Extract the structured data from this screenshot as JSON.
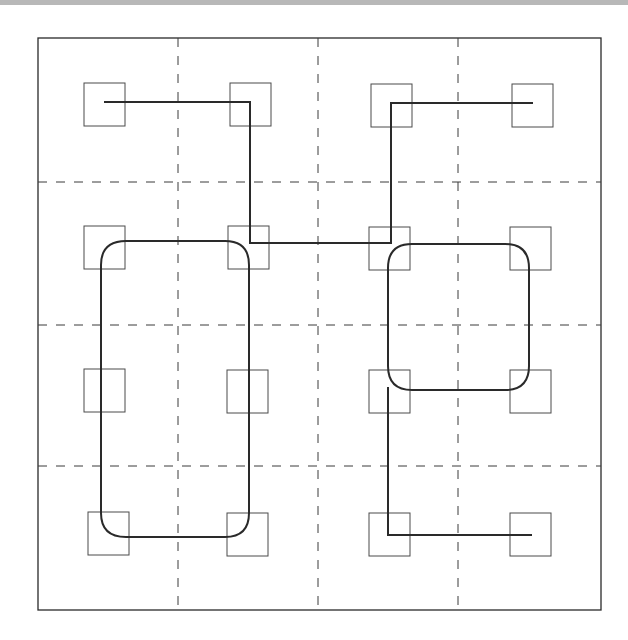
{
  "diagram": {
    "frame": {
      "x": 38,
      "y": 38,
      "width": 563,
      "height": 572
    },
    "colors": {
      "stroke": "#2a2a2a",
      "grid": "#3a3a3a",
      "box": "#4a4a4a",
      "background": "#ffffff",
      "topbar": "#b8b8b8"
    },
    "grid_lines": {
      "vertical_x": [
        178,
        318,
        458
      ],
      "horizontal_y": [
        182,
        325,
        466
      ]
    },
    "boxes": [
      {
        "row": 0,
        "col": 0,
        "x": 84,
        "y": 83,
        "size": 41
      },
      {
        "row": 0,
        "col": 1,
        "x": 230,
        "y": 83,
        "size": 41
      },
      {
        "row": 0,
        "col": 2,
        "x": 371,
        "y": 84,
        "size": 41
      },
      {
        "row": 0,
        "col": 3,
        "x": 512,
        "y": 84,
        "size": 41
      },
      {
        "row": 1,
        "col": 0,
        "x": 84,
        "y": 226,
        "size": 41
      },
      {
        "row": 1,
        "col": 1,
        "x": 228,
        "y": 226,
        "size": 41
      },
      {
        "row": 1,
        "col": 2,
        "x": 369,
        "y": 227,
        "size": 41
      },
      {
        "row": 1,
        "col": 3,
        "x": 510,
        "y": 227,
        "size": 41
      },
      {
        "row": 2,
        "col": 0,
        "x": 84,
        "y": 369,
        "size": 41
      },
      {
        "row": 2,
        "col": 1,
        "x": 227,
        "y": 370,
        "size": 41
      },
      {
        "row": 2,
        "col": 2,
        "x": 369,
        "y": 370,
        "size": 41
      },
      {
        "row": 2,
        "col": 3,
        "x": 510,
        "y": 370,
        "size": 41
      },
      {
        "row": 3,
        "col": 0,
        "x": 88,
        "y": 512,
        "size": 41
      },
      {
        "row": 3,
        "col": 1,
        "x": 227,
        "y": 513,
        "size": 41
      },
      {
        "row": 3,
        "col": 2,
        "x": 369,
        "y": 513,
        "size": 41
      },
      {
        "row": 3,
        "col": 3,
        "x": 510,
        "y": 513,
        "size": 41
      }
    ],
    "paths": [
      {
        "name": "top-route",
        "d": "M104 102 L250 102 L250 243 L391 243 L391 103 L533 103"
      },
      {
        "name": "left-loop",
        "d": "M126 241 L225 241 Q249 241 249 265 L249 513 Q249 537 225 537 L126 537 Q101 537 101 513 L101 265 Q101 241 126 241 Z"
      },
      {
        "name": "right-loop",
        "d": "M412 244 L505 244 Q529 244 529 268 L529 366 Q529 390 505 390 L412 390 Q388 390 388 366 L388 268 Q388 244 412 244 Z"
      },
      {
        "name": "bottom-route",
        "d": "M388 387 L388 535 L532 535"
      }
    ]
  }
}
